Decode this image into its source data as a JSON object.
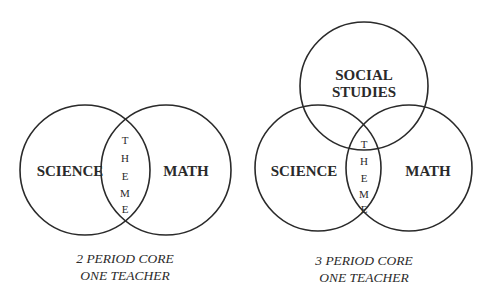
{
  "diagrams": [
    {
      "id": "two-period",
      "circles": {
        "left": "SCIENCE",
        "right": "MATH"
      },
      "overlap_label": [
        "T",
        "H",
        "E",
        "M",
        "E"
      ],
      "caption": {
        "line1": "2 PERIOD CORE",
        "line2": "ONE TEACHER"
      }
    },
    {
      "id": "three-period",
      "circles": {
        "top_line1": "SOCIAL",
        "top_line2": "STUDIES",
        "left": "SCIENCE",
        "right": "MATH"
      },
      "overlap_label": [
        "T",
        "H",
        "E",
        "M",
        "E"
      ],
      "caption": {
        "line1": "3 PERIOD CORE",
        "line2": "ONE TEACHER"
      }
    }
  ],
  "colors": {
    "stroke": "#2a2a2a",
    "background": "#ffffff"
  }
}
